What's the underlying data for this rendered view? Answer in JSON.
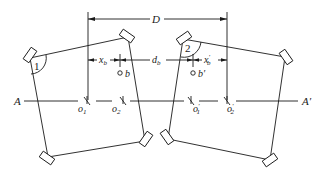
{
  "diagram": {
    "type": "engineering-schematic",
    "axis": {
      "start_label": "A",
      "end_label": "A'",
      "y": 101,
      "x_start": 20,
      "x_end": 302
    },
    "reference_lines": {
      "left_x": 88,
      "right_x": 227,
      "top_y": 12,
      "bottom_y": 100
    },
    "dimensions": {
      "D": {
        "label": "D",
        "y": 18,
        "x1": 88,
        "x2": 227
      },
      "x_b": {
        "label": "x",
        "sub": "b",
        "y": 60,
        "x1": 88,
        "x2": 120
      },
      "d_b": {
        "label": "d",
        "sub": "b",
        "y": 60,
        "x1": 120,
        "x2": 193
      },
      "x_b_prime": {
        "label": "x",
        "sub": "b",
        "prime": "′",
        "y": 60,
        "x1": 193,
        "x2": 227
      }
    },
    "points": [
      {
        "id": "o1",
        "label": "o",
        "sub": "1",
        "x": 87,
        "y": 101
      },
      {
        "id": "o2",
        "label": "o",
        "sub": "2",
        "x": 123,
        "y": 101
      },
      {
        "id": "o1p",
        "label": "o",
        "sub": "1",
        "prime": "′",
        "x": 191,
        "y": 101
      },
      {
        "id": "o2p",
        "label": "o",
        "sub": "2",
        "prime": "′",
        "x": 227,
        "y": 101
      },
      {
        "id": "b",
        "label": "b",
        "x": 120,
        "y": 72
      },
      {
        "id": "bp",
        "label": "b′",
        "x": 193,
        "y": 72
      }
    ],
    "bodies": [
      {
        "id": "body-1",
        "number": "1",
        "corners": [
          [
            30,
            58
          ],
          [
            128,
            37
          ],
          [
            145,
            141
          ],
          [
            48,
            157
          ]
        ]
      },
      {
        "id": "body-2",
        "number": "2",
        "corners": [
          [
            183,
            39
          ],
          [
            285,
            57
          ],
          [
            270,
            160
          ],
          [
            168,
            139
          ]
        ]
      }
    ],
    "labels": {
      "D": "D",
      "x": "x",
      "d": "d",
      "b_sub": "b",
      "b_point": "b",
      "b_prime_point": "b′",
      "o": "o",
      "one": "1",
      "two": "2",
      "prime": "′",
      "body1_number": "1",
      "body2_number": "2",
      "axis_left": "A",
      "axis_right": "A′"
    },
    "colors": {
      "line": "#1a1a1a",
      "background": "#ffffff"
    }
  }
}
